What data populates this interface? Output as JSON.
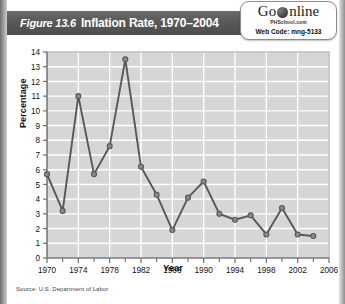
{
  "figure": {
    "number": "Figure 13.6",
    "title": "Inflation Rate, 1970–2004"
  },
  "badge": {
    "go": "Go",
    "online": "nline",
    "globe_icon": "globe-icon",
    "site": "PHSchool.com",
    "web_code": "Web Code: mng-5133"
  },
  "source": "Source: U.S. Department of Labor",
  "colors": {
    "title_bar": "#5a5a5a",
    "plot_background": "#d6d6d6",
    "gridline": "#ffffff",
    "series_line": "#58585a",
    "marker_fill": "#8a8a8c",
    "axis": "#6e6e6e"
  },
  "chart_data": {
    "type": "line",
    "title": "Inflation Rate, 1970–2004",
    "xlabel": "Year",
    "ylabel": "Percentage",
    "xlim": [
      1970,
      2006
    ],
    "ylim": [
      0,
      14
    ],
    "grid": true,
    "legend": "none",
    "x_tick_labels": [
      "1970",
      "1974",
      "1978",
      "1982",
      "1986",
      "1990",
      "1994",
      "1998",
      "2002",
      "2006"
    ],
    "x_tick_values": [
      1970,
      1974,
      1978,
      1982,
      1986,
      1990,
      1994,
      1998,
      2002,
      2006
    ],
    "x_minor_tick_values": [
      1972,
      1976,
      1980,
      1984,
      1988,
      1992,
      1996,
      2000,
      2004
    ],
    "y_tick_labels": [
      "0",
      "1",
      "2",
      "3",
      "4",
      "5",
      "6",
      "7",
      "8",
      "9",
      "10",
      "11",
      "12",
      "13",
      "14"
    ],
    "y_tick_values": [
      0,
      1,
      2,
      3,
      4,
      5,
      6,
      7,
      8,
      9,
      10,
      11,
      12,
      13,
      14
    ],
    "x": [
      1970,
      1972,
      1974,
      1976,
      1978,
      1980,
      1982,
      1984,
      1986,
      1988,
      1990,
      1992,
      1994,
      1996,
      1998,
      2000,
      2002,
      2004
    ],
    "values": [
      5.7,
      3.2,
      11.0,
      5.7,
      7.6,
      13.5,
      6.2,
      4.3,
      1.9,
      4.1,
      5.2,
      3.0,
      2.6,
      2.9,
      1.6,
      3.4,
      1.6,
      1.5
    ],
    "series": [
      {
        "name": "Inflation Rate",
        "values": [
          5.7,
          3.2,
          11.0,
          5.7,
          7.6,
          13.5,
          6.2,
          4.3,
          1.9,
          4.1,
          5.2,
          3.0,
          2.6,
          2.9,
          1.6,
          3.4,
          1.6,
          1.5
        ]
      }
    ]
  }
}
